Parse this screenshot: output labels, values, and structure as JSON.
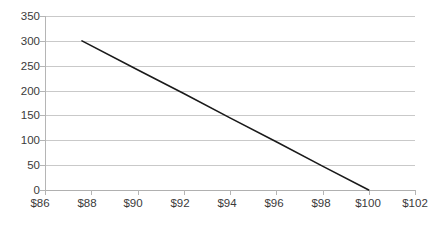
{
  "chart_data": {
    "type": "line",
    "title": "",
    "xlabel": "",
    "ylabel": "",
    "xlim": [
      86,
      102
    ],
    "ylim": [
      0,
      350
    ],
    "grid": true,
    "legend": "none",
    "x_tick_labels": [
      "$86",
      "$88",
      "$90",
      "$92",
      "$94",
      "$96",
      "$98",
      "$100",
      "$102"
    ],
    "x_tick_values": [
      86,
      88,
      90,
      92,
      94,
      96,
      98,
      100,
      102
    ],
    "y_tick_labels": [
      "350",
      "300",
      "250",
      "200",
      "150",
      "100",
      "50",
      "0"
    ],
    "y_tick_values": [
      350,
      300,
      250,
      200,
      150,
      100,
      50,
      0
    ],
    "series": [
      {
        "name": "",
        "color": "#1a1a1a",
        "x": [
          87.6,
          100.0
        ],
        "values": [
          300,
          0
        ],
        "points": [
          {
            "x": 87.6,
            "y": 300
          },
          {
            "x": 90.0,
            "y": 242
          },
          {
            "x": 92.0,
            "y": 194
          },
          {
            "x": 94.0,
            "y": 145
          },
          {
            "x": 96.0,
            "y": 97
          },
          {
            "x": 98.0,
            "y": 48
          },
          {
            "x": 100.0,
            "y": 0
          }
        ]
      }
    ],
    "colors": {
      "gridline": "#c9c9c9",
      "axis": "#b5b5b5",
      "text": "#3a3a3a",
      "line": "#1a1a1a",
      "background": "#ffffff"
    }
  }
}
